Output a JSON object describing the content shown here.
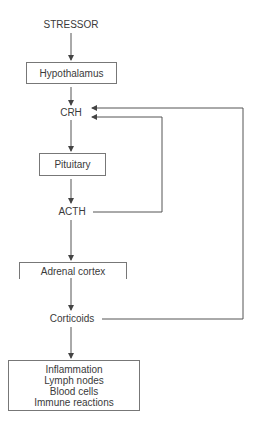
{
  "diagram": {
    "nodes": {
      "stressor": "STRESSOR",
      "hypothalamus": "Hypothalamus",
      "crh": "CRH",
      "pituitary": "Pituitary",
      "acth": "ACTH",
      "adrenal_cortex": "Adrenal cortex",
      "corticoids": "Corticoids",
      "effects": [
        "Inflammation",
        "Lymph nodes",
        "Blood cells",
        "Immune reactions"
      ]
    },
    "edges": [
      {
        "from": "STRESSOR",
        "to": "Hypothalamus"
      },
      {
        "from": "Hypothalamus",
        "to": "CRH"
      },
      {
        "from": "CRH",
        "to": "Pituitary"
      },
      {
        "from": "Pituitary",
        "to": "ACTH"
      },
      {
        "from": "ACTH",
        "to": "Adrenal cortex"
      },
      {
        "from": "Adrenal cortex",
        "to": "Corticoids"
      },
      {
        "from": "Corticoids",
        "to": "Effects"
      },
      {
        "from": "ACTH",
        "to": "CRH",
        "type": "feedback"
      },
      {
        "from": "Corticoids",
        "to": "CRH",
        "type": "feedback"
      }
    ]
  }
}
